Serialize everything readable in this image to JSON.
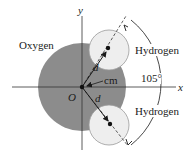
{
  "figure": {
    "labels": {
      "oxygen": "Oxygen",
      "hydrogen_top": "Hydrogen",
      "hydrogen_bottom": "Hydrogen",
      "angle": "105°",
      "distance_top": "d",
      "distance_bottom": "d",
      "center_of_mass": "cm",
      "origin": "O",
      "x_axis": "x",
      "y_axis": "y"
    },
    "colors": {
      "oxygen_fill": "#8c8c8c",
      "hydrogen_fill": "#eeeeee",
      "hydrogen_stroke": "#9a9a9a",
      "axis": "#333333",
      "line": "#1a1a1a"
    },
    "bond_angle_degrees": 105
  }
}
